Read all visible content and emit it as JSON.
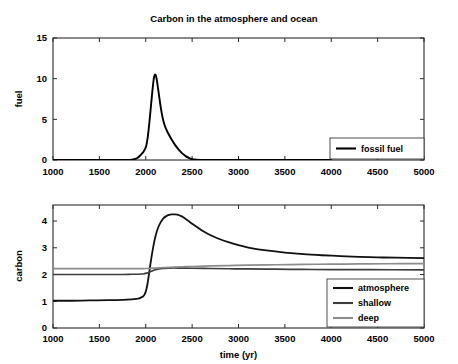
{
  "figure": {
    "title": "Carbon in the atmosphere and ocean",
    "background": "#ffffff"
  },
  "chart_data": [
    {
      "id": "fuel_panel",
      "type": "line",
      "title": "Carbon in the atmosphere and ocean",
      "xlabel": "",
      "ylabel": "fuel",
      "xlim": [
        1000,
        5000
      ],
      "ylim": [
        0,
        15
      ],
      "xticks": [
        1000,
        1500,
        2000,
        2500,
        3000,
        3500,
        4000,
        4500,
        5000
      ],
      "xticklabels": [
        "1000",
        "1500",
        "2000",
        "2500",
        "3000",
        "3500",
        "4000",
        "4500",
        "5000"
      ],
      "yticks": [
        0,
        5,
        10,
        15
      ],
      "yticklabels": [
        "0",
        "5",
        "10",
        "15"
      ],
      "grid": false,
      "legend_position": "lower right",
      "series": [
        {
          "name": "fossil fuel",
          "color": "#000000",
          "width": 1.9,
          "x": [
            1000,
            1500,
            1700,
            1800,
            1850,
            1875,
            1900,
            1920,
            1940,
            1960,
            1975,
            1990,
            2000,
            2010,
            2020,
            2030,
            2040,
            2050,
            2060,
            2070,
            2080,
            2090,
            2100,
            2110,
            2120,
            2130,
            2145,
            2160,
            2180,
            2200,
            2220,
            2250,
            2280,
            2310,
            2340,
            2370,
            2400,
            2430,
            2460,
            2500,
            2600,
            2800,
            3000,
            3500,
            4000,
            4500,
            5000
          ],
          "y": [
            0.0,
            0.0,
            0.0,
            0.02,
            0.05,
            0.1,
            0.2,
            0.35,
            0.55,
            0.8,
            1.0,
            1.3,
            1.55,
            2.0,
            2.7,
            3.6,
            4.7,
            5.9,
            7.1,
            8.3,
            9.4,
            10.2,
            10.5,
            10.35,
            9.8,
            9.0,
            7.8,
            6.6,
            5.3,
            4.4,
            3.8,
            3.1,
            2.5,
            1.95,
            1.5,
            1.1,
            0.75,
            0.48,
            0.28,
            0.1,
            0.01,
            0.0,
            0.0,
            0.0,
            0.0,
            0.0
          ]
        }
      ]
    },
    {
      "id": "carbon_panel",
      "type": "line",
      "title": "",
      "xlabel": "time (yr)",
      "ylabel": "carbon",
      "xlim": [
        1000,
        5000
      ],
      "ylim": [
        0,
        4.6
      ],
      "xticks": [
        1000,
        1500,
        2000,
        2500,
        3000,
        3500,
        4000,
        4500,
        5000
      ],
      "xticklabels": [
        "1000",
        "1500",
        "2000",
        "2500",
        "3000",
        "3500",
        "4000",
        "4500",
        "5000"
      ],
      "yticks": [
        0,
        1,
        2,
        3,
        4
      ],
      "yticklabels": [
        "0",
        "1",
        "2",
        "3",
        "4"
      ],
      "grid": false,
      "legend_position": "lower right",
      "series": [
        {
          "name": "atmosphere",
          "color": "#111111",
          "width": 1.8,
          "x": [
            1000,
            1200,
            1400,
            1600,
            1750,
            1850,
            1900,
            1930,
            1950,
            1970,
            1985,
            2000,
            2015,
            2030,
            2050,
            2070,
            2090,
            2110,
            2130,
            2160,
            2190,
            2220,
            2250,
            2280,
            2310,
            2340,
            2370,
            2400,
            2450,
            2500,
            2560,
            2620,
            2700,
            2800,
            2900,
            3000,
            3150,
            3300,
            3500,
            3700,
            3900,
            4100,
            4300,
            4500,
            4700,
            5000
          ],
          "y": [
            1.02,
            1.02,
            1.03,
            1.04,
            1.05,
            1.07,
            1.09,
            1.11,
            1.14,
            1.18,
            1.24,
            1.36,
            1.58,
            1.9,
            2.38,
            2.82,
            3.2,
            3.5,
            3.72,
            3.95,
            4.1,
            4.18,
            4.23,
            4.25,
            4.25,
            4.24,
            4.2,
            4.15,
            4.03,
            3.9,
            3.76,
            3.62,
            3.47,
            3.32,
            3.2,
            3.1,
            2.98,
            2.9,
            2.82,
            2.76,
            2.72,
            2.69,
            2.66,
            2.64,
            2.63,
            2.61
          ]
        },
        {
          "name": "shallow",
          "color": "#3d3d3d",
          "width": 1.7,
          "x": [
            1000,
            1400,
            1700,
            1850,
            1900,
            1950,
            1980,
            2000,
            2020,
            2040,
            2060,
            2080,
            2100,
            2130,
            2160,
            2200,
            2250,
            2300,
            2400,
            2500,
            2700,
            2900,
            3100,
            3400,
            3700,
            4000,
            4400,
            5000
          ],
          "y": [
            2.0,
            2.0,
            2.0,
            2.01,
            2.01,
            2.02,
            2.03,
            2.04,
            2.06,
            2.09,
            2.12,
            2.15,
            2.18,
            2.2,
            2.22,
            2.23,
            2.24,
            2.245,
            2.24,
            2.235,
            2.225,
            2.215,
            2.21,
            2.2,
            2.19,
            2.185,
            2.18,
            2.175
          ]
        },
        {
          "name": "deep",
          "color": "#8c8c8c",
          "width": 1.7,
          "x": [
            1000,
            1500,
            1800,
            1900,
            1950,
            2000,
            2050,
            2100,
            2150,
            2200,
            2300,
            2400,
            2500,
            2700,
            2900,
            3100,
            3400,
            3700,
            4000,
            4300,
            4600,
            5000
          ],
          "y": [
            2.22,
            2.22,
            2.22,
            2.22,
            2.222,
            2.225,
            2.23,
            2.24,
            2.25,
            2.26,
            2.275,
            2.29,
            2.3,
            2.32,
            2.335,
            2.35,
            2.365,
            2.378,
            2.388,
            2.396,
            2.402,
            2.41
          ]
        }
      ]
    }
  ],
  "legends": {
    "fuel": {
      "entries": [
        {
          "label": "fossil fuel",
          "color": "#000000"
        }
      ]
    },
    "carbon": {
      "entries": [
        {
          "label": "atmosphere",
          "color": "#111111"
        },
        {
          "label": "shallow",
          "color": "#3d3d3d"
        },
        {
          "label": "deep",
          "color": "#8c8c8c"
        }
      ]
    }
  }
}
